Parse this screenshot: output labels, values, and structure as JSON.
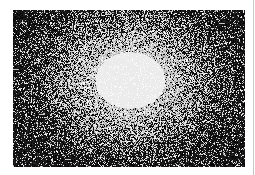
{
  "image": {
    "description": "Grainy black-and-white noise field with a bright white radial glow in the center",
    "width": 232,
    "height": 157,
    "center_x": 117,
    "center_y": 70,
    "sigma_x": 52,
    "sigma_y": 42,
    "background_color": "#000000",
    "highlight_color": "#ffffff"
  },
  "frame": {
    "background_color": "#ffffff",
    "edge_line_color": "#c8c8c8"
  }
}
